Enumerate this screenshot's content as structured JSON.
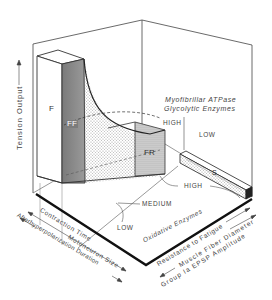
{
  "diagram": {
    "type": "3d-schematic",
    "vertical_axis": {
      "label": "Tension  Output",
      "arrow": "up"
    },
    "front_left_axes": [
      {
        "label": "Contraction  Time",
        "arrow": "none"
      },
      {
        "label": "Motoneuron  Size",
        "arrow": "both"
      },
      {
        "label": "Afterhyperpolarization  Duration",
        "arrow": "both"
      }
    ],
    "front_right_axes": [
      {
        "label": "Resistance  to  Fatigue",
        "arrow": "right"
      },
      {
        "label": "Muscle  Fiber  Diameter",
        "arrow": "left"
      },
      {
        "label": "Group  Ia  EPSP  Amplitude",
        "arrow": "right"
      }
    ],
    "enzyme_labels": {
      "myofibrillar": "Myofibrillar  ATPase",
      "glycolytic": "Glycolytic  Enzymes",
      "back_high": "HIGH",
      "back_low": "LOW",
      "oxidative": "Oxidative  Enzymes",
      "ox_low": "LOW",
      "ox_medium": "MEDIUM",
      "ox_high": "HIGH"
    },
    "motor_units": [
      {
        "id": "F",
        "label": "F",
        "shade": "#ffffff"
      },
      {
        "id": "FF",
        "label": "FF",
        "shade": "#8a8a8a"
      },
      {
        "id": "FR",
        "label": "FR",
        "shade": "#c8c8c8"
      },
      {
        "id": "S",
        "label": "S",
        "shade": "#e6e6e6"
      }
    ],
    "colors": {
      "line": "#333333",
      "thick_line": "#111111",
      "ff_face": "#8c8c8c",
      "stipple": "#bdbdbd"
    }
  }
}
